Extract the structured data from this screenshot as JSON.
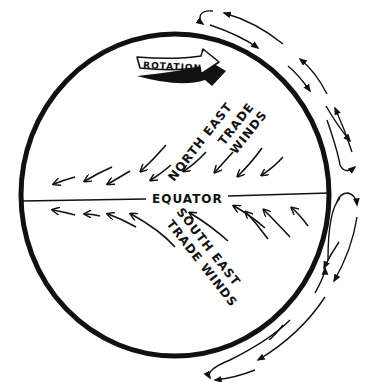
{
  "diagram": {
    "colors": {
      "ink": "#111111",
      "background": "#ffffff"
    },
    "labels": {
      "rotation": "ROTATION",
      "equator": "EQUATOR",
      "ne_line1": "NORTH EAST",
      "ne_line2": "TRADE",
      "ne_line3": "WINDS",
      "se_line1": "SOUTH EAST",
      "se_line2": "TRADE WINDS"
    },
    "elements": {
      "globe": "Earth cross-section circle",
      "equator_line": "horizontal line across globe",
      "rotation_arrow": "banner arrow pointing right (east)",
      "ne_wind_arrows": "arrows pointing south-west toward equator",
      "se_wind_arrows": "arrows pointing north-west toward equator",
      "circulation_cells": "loops of arrows outside the globe on the right side"
    }
  }
}
